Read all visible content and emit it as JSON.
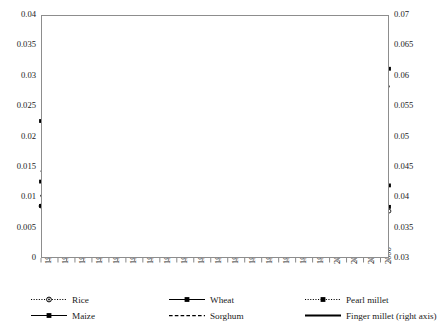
{
  "figure": {
    "clipped_header_text": "",
    "background": "#ffffff",
    "line_color": "#000000",
    "grid_color": "#b7b7b7",
    "frame_color": "#8d8d8d"
  },
  "axes": {
    "left": {
      "label": "",
      "min": 0,
      "max": 0.04,
      "step": 0.005,
      "ticks": [
        "0.04",
        "0.035",
        "0.03",
        "0.025",
        "0.02",
        "0.015",
        "0.01",
        "0.005",
        "0"
      ]
    },
    "right": {
      "label": "",
      "min": 0.03,
      "max": 0.07,
      "step": 0.005,
      "ticks": [
        "0.07",
        "0.065",
        "0.06",
        "0.055",
        "0.05",
        "0.045",
        "0.04",
        "0.035",
        "0.03"
      ]
    },
    "x": {
      "label": "",
      "min": 1966,
      "max": 2007,
      "tick_step": 2,
      "ticks": [
        "1966",
        "1968",
        "1970",
        "1972",
        "1974",
        "1976",
        "1978",
        "1980",
        "1982",
        "1984",
        "1986",
        "1988",
        "1990",
        "1992",
        "1994",
        "1996",
        "1998",
        "2000",
        "2002",
        "2004",
        "2006"
      ]
    }
  },
  "legend": {
    "position": "bottom",
    "rows": [
      [
        {
          "label": "Rice",
          "style": "dotted-circle",
          "axis": "left"
        },
        {
          "label": "Wheat",
          "style": "solid-square",
          "axis": "left"
        },
        {
          "label": "Pearl millet",
          "style": "dotted-square",
          "axis": "left"
        }
      ],
      [
        {
          "label": "Maize",
          "style": "solid-square",
          "axis": "left"
        },
        {
          "label": "Sorghum",
          "style": "dashed",
          "axis": "left"
        },
        {
          "label": "Finger millet (right axis)",
          "style": "solid-thick",
          "axis": "right"
        }
      ]
    ]
  },
  "chart_data": {
    "type": "line",
    "title": "",
    "xlabel": "",
    "ylabel": "",
    "ylim": [
      0,
      0.04
    ],
    "y2lim": [
      0.03,
      0.07
    ],
    "xlim": [
      1966,
      2007
    ],
    "grid": "horizontal",
    "legend_position": "bottom",
    "x": [
      1966,
      1967,
      1968,
      1969,
      1970,
      1971,
      1972,
      1973,
      1974,
      1975,
      1976,
      1977,
      1978,
      1979,
      1980,
      1981,
      1982,
      1983,
      1984,
      1985,
      1986,
      1987,
      1988,
      1989,
      1990,
      1991,
      1992,
      1993,
      1994,
      1995,
      1996,
      1997,
      1998,
      1999,
      2000,
      2001,
      2002,
      2003,
      2004,
      2005,
      2006,
      2007
    ],
    "series": [
      {
        "name": "Rice",
        "axis": "left",
        "style": "dotted-circle",
        "values": [
          0.00855,
          0.00852,
          0.0085,
          0.00848,
          0.00845,
          0.0084,
          0.00836,
          0.00832,
          0.00828,
          0.00824,
          0.0082,
          0.00818,
          0.00816,
          0.00814,
          0.00812,
          0.00812,
          0.00812,
          0.00812,
          0.00812,
          0.00814,
          0.00816,
          0.00816,
          0.00816,
          0.00814,
          0.00812,
          0.0081,
          0.00806,
          0.00802,
          0.00798,
          0.00794,
          0.0079,
          0.00788,
          0.00786,
          0.00784,
          0.00782,
          0.00782,
          0.00782,
          0.0078,
          0.00778,
          0.00776,
          0.00774,
          0.00772
        ]
      },
      {
        "name": "Wheat",
        "axis": "left",
        "style": "solid-square",
        "values": [
          0.00858,
          0.00856,
          0.00854,
          0.00852,
          0.0085,
          0.00846,
          0.00842,
          0.00838,
          0.00834,
          0.0083,
          0.00826,
          0.00824,
          0.00822,
          0.0082,
          0.0082,
          0.0082,
          0.0082,
          0.00822,
          0.00824,
          0.00828,
          0.00834,
          0.00838,
          0.0084,
          0.00842,
          0.00844,
          0.00842,
          0.0084,
          0.00838,
          0.00836,
          0.00834,
          0.00834,
          0.00836,
          0.0084,
          0.00846,
          0.00852,
          0.00858,
          0.00856,
          0.0085,
          0.00846,
          0.00844,
          0.00844,
          0.00842
        ]
      },
      {
        "name": "Pearl millet",
        "axis": "left",
        "style": "dotted-square",
        "values": [
          0.02255,
          0.0216,
          0.02015,
          0.02025,
          0.0214,
          0.0233,
          0.02455,
          0.0236,
          0.02205,
          0.02005,
          0.0203,
          0.02195,
          0.02355,
          0.0244,
          0.0252,
          0.0249,
          0.0244,
          0.025,
          0.02515,
          0.0256,
          0.02625,
          0.0261,
          0.02665,
          0.0259,
          0.02665,
          0.027,
          0.0275,
          0.0281,
          0.0286,
          0.0284,
          0.0285,
          0.02865,
          0.0282,
          0.0276,
          0.0264,
          0.0278,
          0.0288,
          0.0301,
          0.02955,
          0.0299,
          0.0306,
          0.03115
        ]
      },
      {
        "name": "Maize",
        "axis": "left",
        "style": "solid-square",
        "values": [
          0.01258,
          0.01248,
          0.0124,
          0.01232,
          0.01224,
          0.01212,
          0.01188,
          0.01165,
          0.0116,
          0.01158,
          0.01162,
          0.01165,
          0.01168,
          0.0117,
          0.01178,
          0.01186,
          0.01192,
          0.01198,
          0.01204,
          0.0121,
          0.01216,
          0.01222,
          0.01226,
          0.01242,
          0.01256,
          0.01285,
          0.01292,
          0.01295,
          0.013,
          0.01318,
          0.01335,
          0.01336,
          0.01324,
          0.013,
          0.01268,
          0.01254,
          0.01246,
          0.0124,
          0.01234,
          0.01228,
          0.01222,
          0.01195
        ]
      },
      {
        "name": "Sorghum",
        "axis": "left",
        "style": "dashed",
        "values": [
          0.01432,
          0.0142,
          0.01404,
          0.0141,
          0.01418,
          0.01428,
          0.01434,
          0.01412,
          0.0146,
          0.01478,
          0.01494,
          0.01512,
          0.01516,
          0.01522,
          0.01534,
          0.01545,
          0.0156,
          0.01585,
          0.01614,
          0.01648,
          0.01684,
          0.01726,
          0.01778,
          0.01835,
          0.0189,
          0.0195,
          0.0201,
          0.0208,
          0.02165,
          0.0226,
          0.0235,
          0.02418,
          0.02434,
          0.0243,
          0.0247,
          0.0252,
          0.0258,
          0.02636,
          0.0268,
          0.0272,
          0.0277,
          0.02832
        ]
      },
      {
        "name": "Finger millet (right axis)",
        "axis": "right",
        "style": "solid-thick",
        "values_right_axis": [
          0.0403,
          0.0369,
          0.03425,
          0.0355,
          0.03655,
          0.03785,
          0.037,
          0.0362,
          0.0351,
          0.034,
          0.0327,
          0.03215,
          0.0323,
          0.0325,
          0.0325,
          0.03225,
          0.0326,
          0.0325,
          0.03245,
          0.0325,
          0.034,
          0.0362,
          0.0387,
          0.0415,
          0.0456,
          0.0487,
          0.0504,
          0.0526,
          0.0556,
          0.0579,
          0.0593,
          0.0601,
          0.0578,
          0.0564,
          0.0543,
          0.0558,
          0.0554,
          0.0562,
          0.0557,
          0.0549,
          0.05525,
          0.0583
        ]
      }
    ]
  }
}
